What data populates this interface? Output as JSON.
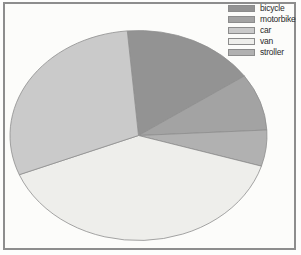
{
  "chart": {
    "background_color": "#fcfcfa",
    "frame_border_color": "#8d8d8d",
    "slice_border_color": "#8e8e8e"
  },
  "legend": {
    "items": [
      {
        "label": "bicycle",
        "color": "#939393"
      },
      {
        "label": "motorbike",
        "color": "#a3a3a3"
      },
      {
        "label": "car",
        "color": "#cacaca"
      },
      {
        "label": "van",
        "color": "#eeeeeb"
      },
      {
        "label": "stroller",
        "color": "#b1b1b1"
      }
    ]
  },
  "chart_data": {
    "type": "pie",
    "title": "",
    "legend_position": "top-right",
    "categories": [
      "bicycle",
      "motorbike",
      "car",
      "van",
      "stroller"
    ],
    "values_percent": [
      16.8,
      8.75,
      29.7,
      39.2,
      5.55
    ],
    "start_angle_deg": 95,
    "direction": "clockwise",
    "draw_order": [
      "bicycle",
      "motorbike",
      "stroller",
      "van",
      "car"
    ],
    "slices": [
      {
        "label": "bicycle",
        "color": "#939393",
        "percent": 16.8,
        "span_deg": 60.5
      },
      {
        "label": "motorbike",
        "color": "#a3a3a3",
        "percent": 8.75,
        "span_deg": 31.5
      },
      {
        "label": "stroller",
        "color": "#b1b1b1",
        "percent": 5.55,
        "span_deg": 20.0
      },
      {
        "label": "van",
        "color": "#eeeeeb",
        "percent": 39.2,
        "span_deg": 141.0
      },
      {
        "label": "car",
        "color": "#cacaca",
        "percent": 29.7,
        "span_deg": 107.0
      }
    ]
  }
}
